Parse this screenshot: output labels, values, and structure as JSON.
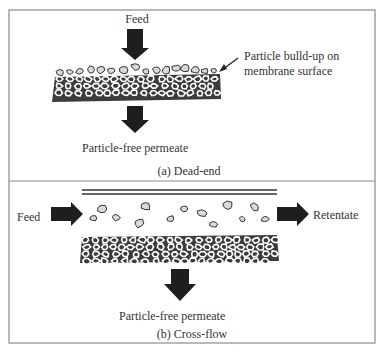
{
  "figure": {
    "panel_a": {
      "caption": "(a) Dead-end",
      "feed_label": "Feed",
      "annotation_line1": "Particle bulld-up on",
      "annotation_line2": "membrane surface",
      "permeate_label": "Particle-free permeate"
    },
    "panel_b": {
      "caption": "(b) Cross-flow",
      "feed_label": "Feed",
      "retentate_label": "Retentate",
      "permeate_label": "Particle-free permeate"
    },
    "icons": {
      "feed_arrow": "down-arrow",
      "permeate_arrow": "down-arrow",
      "crossflow_feed_arrow": "right-arrow",
      "retentate_arrow": "right-arrow",
      "annotation_pointer": "leader-arrow"
    },
    "colors": {
      "frame": "#8a8a8a",
      "arrow": "#1e1e1e",
      "membrane_grain": "#3c3c3c",
      "particle_fill": "#d9d9d9",
      "particle_outline": "#333333",
      "text": "#333333"
    }
  }
}
